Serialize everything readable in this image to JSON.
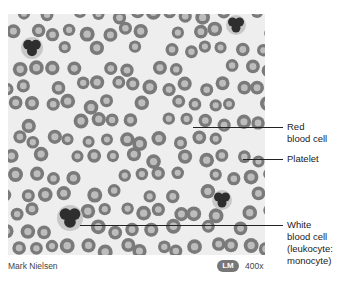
{
  "figure": {
    "labels": [
      {
        "id": "red-blood-cell",
        "text": "Red\nblood cell",
        "x": 287,
        "y": 121,
        "line": {
          "x1": 193,
          "x2": 283,
          "y": 127
        }
      },
      {
        "id": "platelet",
        "text": "Platelet",
        "x": 287,
        "y": 153,
        "line": {
          "x1": 243,
          "x2": 283,
          "y": 159
        }
      },
      {
        "id": "white-blood-cell",
        "text": "White\nblood cell\n(leukocyte:\nmonocyte)",
        "x": 287,
        "y": 219,
        "line": {
          "x1": 80,
          "x2": 283,
          "y": 225
        }
      }
    ],
    "credit": "Mark Nielsen",
    "technique_badge": "LM",
    "magnification": "400x"
  },
  "micrograph": {
    "colors": {
      "background": "#eeeeee",
      "rbc_rim": "#7a7a7a",
      "rbc_center": "#bdbdbd",
      "wbc_nucleus": "#2e2e2e",
      "wbc_cytoplasm": "#c8c8c8"
    },
    "white_cells": [
      {
        "x": 32,
        "y": 48,
        "r": 11
      },
      {
        "x": 236,
        "y": 25,
        "r": 10
      },
      {
        "x": 70,
        "y": 218,
        "r": 13
      },
      {
        "x": 222,
        "y": 200,
        "r": 10
      }
    ]
  }
}
